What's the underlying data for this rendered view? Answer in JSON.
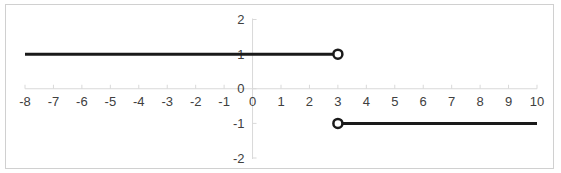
{
  "chart_data": {
    "type": "line",
    "title": "",
    "xlabel": "",
    "ylabel": "",
    "xlim": [
      -8,
      10
    ],
    "ylim": [
      -2,
      2
    ],
    "x_ticks": [
      -8,
      -7,
      -6,
      -5,
      -4,
      -3,
      -2,
      -1,
      0,
      1,
      2,
      3,
      4,
      5,
      6,
      7,
      8,
      9,
      10
    ],
    "y_ticks": [
      -2,
      -1,
      0,
      1,
      2
    ],
    "grid": false,
    "legend": null,
    "series": [
      {
        "name": "segment-left",
        "x": [
          -8,
          3
        ],
        "y": [
          1,
          1
        ],
        "end_marker": {
          "x": 3,
          "y": 1,
          "style": "open-circle"
        }
      },
      {
        "name": "segment-right",
        "x": [
          3,
          10
        ],
        "y": [
          -1,
          -1
        ],
        "start_marker": {
          "x": 3,
          "y": -1,
          "style": "open-circle"
        }
      }
    ],
    "colors": {
      "line": "#1a1a1a",
      "axis": "#d9d9d9",
      "label": "#404040",
      "border": "#d0d0d0"
    }
  }
}
